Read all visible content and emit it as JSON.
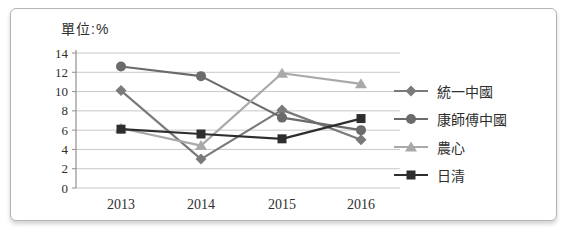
{
  "chart_data": {
    "type": "line",
    "unit_label": "單位:%",
    "categories": [
      "2013",
      "2014",
      "2015",
      "2016"
    ],
    "ylim": [
      0,
      14
    ],
    "ytick_step": 2,
    "grid": true,
    "legend_position": "right",
    "series": [
      {
        "name": "統一中國",
        "marker": "diamond",
        "color": "#7a7a7a",
        "values": [
          10.1,
          3.0,
          8.1,
          5.0
        ]
      },
      {
        "name": "康師傅中國",
        "marker": "circle",
        "color": "#6b6b6b",
        "values": [
          12.6,
          11.6,
          7.3,
          6.0
        ]
      },
      {
        "name": "農心",
        "marker": "triangle",
        "color": "#a9a9a9",
        "values": [
          6.2,
          4.4,
          11.9,
          10.8
        ]
      },
      {
        "name": "日清",
        "marker": "square",
        "color": "#2e2e2e",
        "values": [
          6.1,
          5.6,
          5.1,
          7.2
        ]
      }
    ],
    "style": {
      "gridline_color": "#c8c8c8",
      "axis_color": "#8f8f8f",
      "tick_label_color": "#2f2f2f"
    }
  }
}
